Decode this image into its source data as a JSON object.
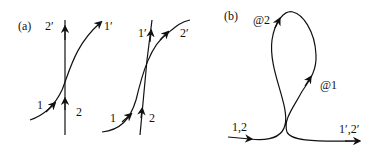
{
  "panel_a": {
    "label": "(a)",
    "left": {
      "in_1": "1",
      "in_2": "2",
      "out_1": "1′",
      "out_2": "2′"
    },
    "right": {
      "in_1": "1",
      "in_2": "2",
      "out_1": "1′",
      "out_2": "2′"
    }
  },
  "panel_b": {
    "label": "(b)",
    "in": "1,2",
    "out": "1′,2′",
    "at1": "@1",
    "at2": "@2"
  },
  "colors": {
    "stroke": "#111111",
    "background": "#ffffff"
  }
}
